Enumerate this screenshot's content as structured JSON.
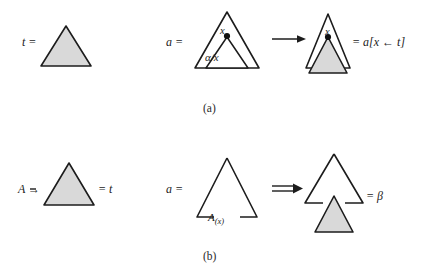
{
  "figure": {
    "type": "diagram",
    "background_color": "#ffffff",
    "stroke_color": "#1c1c1c",
    "fill_shaded": "#d9d9d9",
    "panels": [
      {
        "id": "a",
        "caption": "(a)",
        "operation": "substitution",
        "items": [
          {
            "name": "tree-t",
            "label": "t =",
            "shape": "filled-triangle",
            "shaded": true
          },
          {
            "name": "tree-a",
            "label": "a =",
            "shape": "triangle-with-inner-triangle",
            "shaded": false,
            "node_label": "x",
            "inner_label": "α/x",
            "node_marker": "filled-dot"
          },
          {
            "name": "operator",
            "label": "→",
            "kind": "single-arrow"
          },
          {
            "name": "tree-result",
            "label": "= a[x ← t]",
            "shape": "triangle-with-attached-shaded-triangle",
            "node_label": "x",
            "node_marker": "filled-dot"
          }
        ]
      },
      {
        "id": "b",
        "caption": "(b)",
        "operation": "adjunction",
        "items": [
          {
            "name": "rule-A",
            "label": "A →",
            "result_label": "= t",
            "shape": "filled-triangle",
            "shaded": true
          },
          {
            "name": "tree-a",
            "label": "a =",
            "shape": "triangle-open-base",
            "foot_label": "A",
            "foot_sub": "(x)"
          },
          {
            "name": "operator",
            "label": "⇒",
            "kind": "double-arrow"
          },
          {
            "name": "tree-result",
            "label": "= β",
            "shape": "triangle-open-base-with-shaded-triangle-below"
          }
        ]
      }
    ]
  },
  "labels": {
    "t_equals": "t =",
    "a_equals_top": "a =",
    "x_mid": "x",
    "alpha_over_x": "α/x",
    "x_right": "x",
    "substitution_result": "= a[x ← t]",
    "caption_a": "(a)",
    "A_arrow": "A →",
    "equals_t": "= t",
    "a_equals_bottom": "a =",
    "A_foot": "A",
    "A_foot_sub": "(x)",
    "equals_beta": "= β",
    "caption_b": "(b)"
  }
}
